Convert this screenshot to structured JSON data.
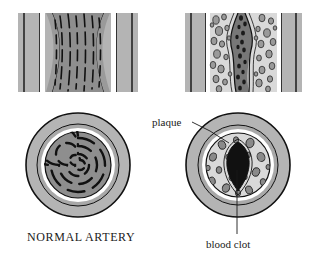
{
  "figure": {
    "title_visible": false,
    "background_color": "#ffffff",
    "width": 326,
    "height": 259
  },
  "labels": {
    "plaque": "plaque",
    "blood_clot": "blood clot",
    "normal_artery": "NORMAL ARTERY"
  },
  "colors": {
    "outline": "#111111",
    "adventitia_gray": "#b4b4b4",
    "media_gray": "#9a9a9a",
    "lumen_gray": "#8e8e8e",
    "plaque_light": "#d8d8d8",
    "foam_cell": "#8a8a8a",
    "clot_black": "#111111",
    "white_band": "#ffffff",
    "text": "#1a1a1a"
  },
  "panels": [
    {
      "id": "normal-longitudinal",
      "name": "Normal artery longitudinal section",
      "position": "top-left",
      "x": 18,
      "y": 13,
      "width": 120,
      "height": 79,
      "description": "Straight artery wall with open lumen containing wavy vertical elastic fibers",
      "elastic_fiber_count": 7,
      "lumen_open": true
    },
    {
      "id": "diseased-longitudinal",
      "name": "Atherosclerotic artery longitudinal section",
      "position": "top-right",
      "x": 185,
      "y": 13,
      "width": 117,
      "height": 79,
      "description": "Artery wall thickened by plaque with foam cells, lumen narrowed by blood clot",
      "foam_cell_count": 34,
      "lumen_open": false
    },
    {
      "id": "normal-cross-section",
      "name": "Normal artery cross section",
      "position": "bottom-left",
      "cx": 78,
      "cy": 165,
      "r": 52,
      "description": "Concentric circular wall layers with dashed spiral elastic lamina in open lumen",
      "lumen_open": true
    },
    {
      "id": "diseased-cross-section",
      "name": "Atherosclerotic artery cross section",
      "position": "bottom-right",
      "cx": 238,
      "cy": 165,
      "r": 52,
      "description": "Thickened plaque ring with scattered foam cells and central black blood clot",
      "foam_cell_count": 22,
      "lumen_open": false
    }
  ],
  "annotations": [
    {
      "id": "plaque-annotation",
      "label": "plaque",
      "text_x": 152,
      "text_y": 126,
      "leader_from": [
        191,
        123
      ],
      "leader_to": [
        228,
        143
      ],
      "points_to": "diseased-cross-section"
    },
    {
      "id": "blood-clot-annotation",
      "label": "blood clot",
      "text_x": 205,
      "text_y": 248,
      "leader_from": [
        237,
        168
      ],
      "leader_to": [
        237,
        235
      ],
      "points_to": "diseased-cross-section"
    },
    {
      "id": "normal-artery-caption",
      "label": "NORMAL ARTERY",
      "text_x": 27,
      "text_y": 240,
      "points_to": "normal-cross-section"
    }
  ]
}
